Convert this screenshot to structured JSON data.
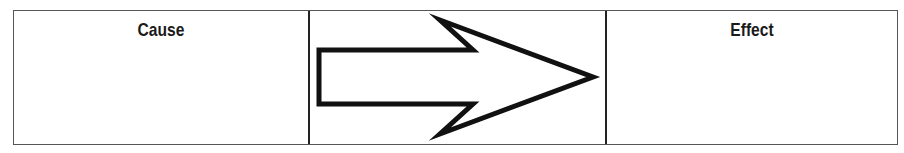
{
  "diagram": {
    "type": "cause-effect",
    "columns": [
      {
        "id": "cause",
        "label": "Cause",
        "content": ""
      },
      {
        "id": "connector",
        "label": "",
        "icon": "right-arrow-icon"
      },
      {
        "id": "effect",
        "label": "Effect",
        "content": ""
      }
    ],
    "colors": {
      "border": "#555555",
      "divider": "#222222",
      "arrow_stroke": "#111111",
      "text": "#1a1a1a"
    }
  }
}
